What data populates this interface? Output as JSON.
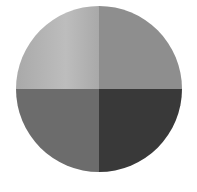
{
  "figure": {
    "shape": "circle",
    "quadrants": [
      {
        "position": "top-left",
        "color": "#bdbdbd",
        "gradient_to": "#a9a9a9"
      },
      {
        "position": "top-right",
        "color": "#8e8e8e"
      },
      {
        "position": "bottom-left",
        "color": "#6c6c6c"
      },
      {
        "position": "bottom-right",
        "color": "#393939"
      }
    ]
  }
}
